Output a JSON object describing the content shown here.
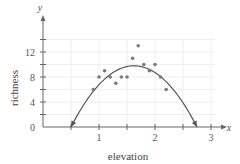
{
  "chart_data": {
    "type": "scatter",
    "title": "",
    "xlabel": "elevation",
    "ylabel": "richness",
    "x_axis_var": "x",
    "y_axis_var": "y",
    "xlim": [
      0,
      3.3
    ],
    "ylim": [
      0,
      16
    ],
    "x_ticks": [
      1,
      2,
      3
    ],
    "x_minor_ticks": [
      0.5,
      1.5,
      2.5
    ],
    "y_ticks": [
      0,
      4,
      8,
      12
    ],
    "y_minor_ticks": [
      2,
      6,
      10,
      14
    ],
    "x_tick_labels": [
      "1",
      "2",
      "3"
    ],
    "y_tick_labels": [
      "0",
      "4",
      "8",
      "12"
    ],
    "grid": true,
    "points": [
      {
        "x": 0.9,
        "y": 6
      },
      {
        "x": 1.0,
        "y": 8
      },
      {
        "x": 1.1,
        "y": 9
      },
      {
        "x": 1.2,
        "y": 8
      },
      {
        "x": 1.3,
        "y": 7
      },
      {
        "x": 1.4,
        "y": 8
      },
      {
        "x": 1.5,
        "y": 8
      },
      {
        "x": 1.6,
        "y": 11
      },
      {
        "x": 1.7,
        "y": 13
      },
      {
        "x": 1.8,
        "y": 10
      },
      {
        "x": 1.9,
        "y": 9
      },
      {
        "x": 2.0,
        "y": 10
      },
      {
        "x": 2.1,
        "y": 8
      },
      {
        "x": 2.2,
        "y": 6
      }
    ],
    "fit_curve": {
      "type": "quadratic",
      "roots": [
        0.5,
        2.75
      ],
      "vertex": {
        "x": 1.625,
        "y": 9.8
      },
      "arrows_at_ends": true
    },
    "colors": {
      "points": "#7a7a7a",
      "curve": "#555555",
      "axis": "#666666",
      "grid": "#eeeeee"
    }
  }
}
